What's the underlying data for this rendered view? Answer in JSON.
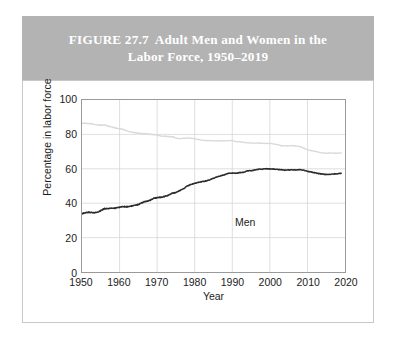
{
  "figure": {
    "number": "FIGURE 27.7",
    "title": "Adult Men and Women in the",
    "title_line2": "Labor Force, 1950–2019",
    "band_color": "#b3b3b3",
    "title_color": "#ffffff"
  },
  "chart_data": {
    "type": "line",
    "title": "",
    "xlabel": "Year",
    "ylabel": "Percentage in labor force",
    "xlim": [
      1950,
      2020
    ],
    "ylim": [
      0,
      100
    ],
    "xticks": [
      1950,
      1960,
      1970,
      1980,
      1990,
      2000,
      2010,
      2020
    ],
    "yticks": [
      0,
      20,
      40,
      60,
      80,
      100
    ],
    "grid": true,
    "legend_position": "inline-annotations",
    "annotations": [
      {
        "text": "Men",
        "x": 1973,
        "y": 86,
        "color": "#1c1c1c"
      },
      {
        "text": "Women",
        "x": 1984,
        "y": 46,
        "color": "#1c1c1c"
      }
    ],
    "series": [
      {
        "name": "Men",
        "color": "#d9d9d9",
        "x": [
          1950,
          1951,
          1952,
          1953,
          1954,
          1955,
          1956,
          1957,
          1958,
          1959,
          1960,
          1961,
          1962,
          1963,
          1964,
          1965,
          1966,
          1967,
          1968,
          1969,
          1970,
          1971,
          1972,
          1973,
          1974,
          1975,
          1976,
          1977,
          1978,
          1979,
          1980,
          1981,
          1982,
          1983,
          1984,
          1985,
          1986,
          1987,
          1988,
          1989,
          1990,
          1991,
          1992,
          1993,
          1994,
          1995,
          1996,
          1997,
          1998,
          1999,
          2000,
          2001,
          2002,
          2003,
          2004,
          2005,
          2006,
          2007,
          2008,
          2009,
          2010,
          2011,
          2012,
          2013,
          2014,
          2015,
          2016,
          2017,
          2018,
          2019
        ],
        "values": [
          86.4,
          86.5,
          86.3,
          86.0,
          85.5,
          85.4,
          85.5,
          84.8,
          84.2,
          83.7,
          83.3,
          82.9,
          82.0,
          81.4,
          81.0,
          80.7,
          80.4,
          80.4,
          80.1,
          79.8,
          79.7,
          79.1,
          78.9,
          78.8,
          78.7,
          77.9,
          77.5,
          77.7,
          77.9,
          77.8,
          77.4,
          77.0,
          76.6,
          76.4,
          76.4,
          76.3,
          76.3,
          76.2,
          76.2,
          76.4,
          76.4,
          75.8,
          75.8,
          75.4,
          75.1,
          75.0,
          74.9,
          75.0,
          74.9,
          74.7,
          74.8,
          74.4,
          74.1,
          73.5,
          73.3,
          73.3,
          73.5,
          73.2,
          73.0,
          72.0,
          71.2,
          70.5,
          70.2,
          69.7,
          69.2,
          69.1,
          69.2,
          69.1,
          69.1,
          69.2
        ],
        "linewidth": 1.3
      },
      {
        "name": "Women",
        "color": "#2b2b2b",
        "x": [
          1950,
          1951,
          1952,
          1953,
          1954,
          1955,
          1956,
          1957,
          1958,
          1959,
          1960,
          1961,
          1962,
          1963,
          1964,
          1965,
          1966,
          1967,
          1968,
          1969,
          1970,
          1971,
          1972,
          1973,
          1974,
          1975,
          1976,
          1977,
          1978,
          1979,
          1980,
          1981,
          1982,
          1983,
          1984,
          1985,
          1986,
          1987,
          1988,
          1989,
          1990,
          1991,
          1992,
          1993,
          1994,
          1995,
          1996,
          1997,
          1998,
          1999,
          2000,
          2001,
          2002,
          2003,
          2004,
          2005,
          2006,
          2007,
          2008,
          2009,
          2010,
          2011,
          2012,
          2013,
          2014,
          2015,
          2016,
          2017,
          2018,
          2019
        ],
        "values": [
          33.9,
          34.6,
          34.7,
          34.4,
          34.6,
          35.7,
          36.9,
          36.9,
          37.1,
          37.1,
          37.7,
          38.1,
          37.9,
          38.3,
          38.7,
          39.3,
          40.3,
          41.1,
          41.6,
          42.7,
          43.3,
          43.4,
          43.9,
          44.7,
          45.7,
          46.3,
          47.3,
          48.4,
          50.0,
          50.9,
          51.5,
          52.1,
          52.6,
          52.9,
          53.6,
          54.5,
          55.3,
          56.0,
          56.6,
          57.4,
          57.5,
          57.4,
          57.8,
          57.9,
          58.8,
          58.9,
          59.3,
          59.8,
          59.8,
          60.0,
          59.9,
          59.8,
          59.6,
          59.5,
          59.2,
          59.3,
          59.4,
          59.3,
          59.5,
          59.2,
          58.6,
          58.1,
          57.7,
          57.2,
          56.9,
          56.7,
          56.8,
          57.0,
          57.1,
          57.4
        ],
        "linewidth": 1.5
      }
    ]
  },
  "axes": {
    "x_tick_labels": [
      "1950",
      "1960",
      "1970",
      "1980",
      "1990",
      "2000",
      "2010",
      "2020"
    ],
    "y_tick_labels": [
      "0",
      "20",
      "40",
      "60",
      "80",
      "100"
    ],
    "x_axis_title": "Year",
    "y_axis_title": "Percentage in labor force",
    "grid_color": "#d6d6d6",
    "frame_color": "#9a9a9a"
  }
}
